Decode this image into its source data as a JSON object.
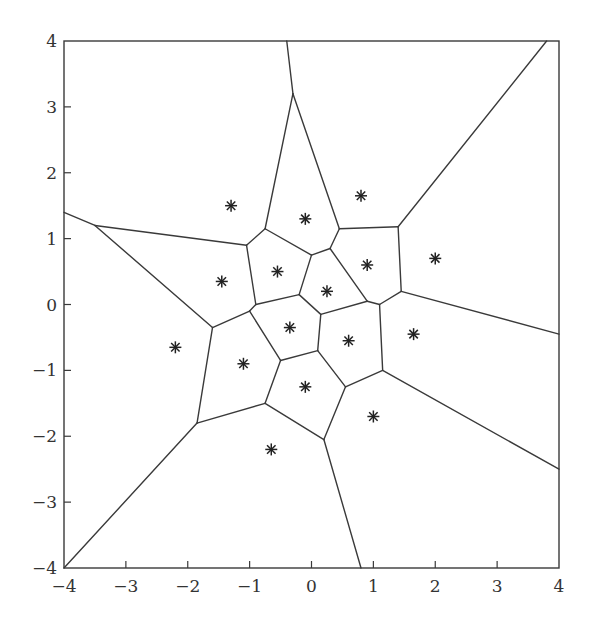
{
  "chart_data": {
    "type": "voronoi",
    "title": "",
    "xlabel": "",
    "ylabel": "",
    "xlim": [
      -4,
      4
    ],
    "ylim": [
      -4,
      4
    ],
    "grid": false,
    "legend": null,
    "x_ticks": [
      -4,
      -3,
      -2,
      -1,
      0,
      1,
      2,
      3,
      4
    ],
    "y_ticks": [
      -4,
      -3,
      -2,
      -1,
      0,
      1,
      2,
      3,
      4
    ],
    "x_tick_labels": [
      "−4",
      "−3",
      "−2",
      "−1",
      "0",
      "1",
      "2",
      "3",
      "4"
    ],
    "y_tick_labels": [
      "−4",
      "−3",
      "−2",
      "−1",
      "0",
      "1",
      "2",
      "3",
      "4"
    ],
    "marker": "asterisk",
    "sites": [
      {
        "x": -1.3,
        "y": 1.5
      },
      {
        "x": -0.1,
        "y": 1.3
      },
      {
        "x": 0.8,
        "y": 1.65
      },
      {
        "x": -1.45,
        "y": 0.35
      },
      {
        "x": -0.55,
        "y": 0.5
      },
      {
        "x": 0.25,
        "y": 0.2
      },
      {
        "x": 0.9,
        "y": 0.6
      },
      {
        "x": 2.0,
        "y": 0.7
      },
      {
        "x": -2.2,
        "y": -0.65
      },
      {
        "x": -1.1,
        "y": -0.9
      },
      {
        "x": -0.35,
        "y": -0.35
      },
      {
        "x": 0.6,
        "y": -0.55
      },
      {
        "x": 1.65,
        "y": -0.45
      },
      {
        "x": -0.1,
        "y": -1.25
      },
      {
        "x": 1.0,
        "y": -1.7
      },
      {
        "x": -0.65,
        "y": -2.2
      }
    ],
    "edges": [
      [
        [
          -0.4,
          4.0
        ],
        [
          -0.3,
          3.2
        ]
      ],
      [
        [
          -0.3,
          3.2
        ],
        [
          -0.75,
          1.15
        ]
      ],
      [
        [
          -0.3,
          3.2
        ],
        [
          0.45,
          1.15
        ]
      ],
      [
        [
          -4.0,
          1.4
        ],
        [
          -3.5,
          1.2
        ]
      ],
      [
        [
          -3.5,
          1.2
        ],
        [
          -1.05,
          0.9
        ]
      ],
      [
        [
          -3.5,
          1.2
        ],
        [
          -1.6,
          -0.35
        ]
      ],
      [
        [
          -1.05,
          0.9
        ],
        [
          -0.75,
          1.15
        ]
      ],
      [
        [
          -0.75,
          1.15
        ],
        [
          0.0,
          0.75
        ]
      ],
      [
        [
          -1.05,
          0.9
        ],
        [
          -0.9,
          0.0
        ]
      ],
      [
        [
          -0.9,
          0.0
        ],
        [
          -0.2,
          0.15
        ]
      ],
      [
        [
          0.0,
          0.75
        ],
        [
          -0.2,
          0.15
        ]
      ],
      [
        [
          0.0,
          0.75
        ],
        [
          0.3,
          0.85
        ]
      ],
      [
        [
          0.3,
          0.85
        ],
        [
          0.45,
          1.15
        ]
      ],
      [
        [
          0.45,
          1.15
        ],
        [
          1.4,
          1.18
        ]
      ],
      [
        [
          1.4,
          1.18
        ],
        [
          3.8,
          4.0
        ]
      ],
      [
        [
          1.4,
          1.18
        ],
        [
          1.45,
          0.2
        ]
      ],
      [
        [
          1.45,
          0.2
        ],
        [
          4.0,
          -0.45
        ]
      ],
      [
        [
          1.45,
          0.2
        ],
        [
          1.1,
          0.0
        ]
      ],
      [
        [
          1.1,
          0.0
        ],
        [
          0.9,
          0.05
        ]
      ],
      [
        [
          0.9,
          0.05
        ],
        [
          0.3,
          0.85
        ]
      ],
      [
        [
          0.9,
          0.05
        ],
        [
          0.15,
          -0.15
        ]
      ],
      [
        [
          -0.2,
          0.15
        ],
        [
          0.15,
          -0.15
        ]
      ],
      [
        [
          -0.9,
          0.0
        ],
        [
          -1.0,
          -0.1
        ]
      ],
      [
        [
          -1.6,
          -0.35
        ],
        [
          -1.0,
          -0.1
        ]
      ],
      [
        [
          -1.6,
          -0.35
        ],
        [
          -1.85,
          -1.8
        ]
      ],
      [
        [
          -1.85,
          -1.8
        ],
        [
          -4.0,
          -4.0
        ]
      ],
      [
        [
          -1.85,
          -1.8
        ],
        [
          -0.75,
          -1.5
        ]
      ],
      [
        [
          -1.0,
          -0.1
        ],
        [
          -0.5,
          -0.85
        ]
      ],
      [
        [
          -0.5,
          -0.85
        ],
        [
          0.1,
          -0.7
        ]
      ],
      [
        [
          0.15,
          -0.15
        ],
        [
          0.1,
          -0.7
        ]
      ],
      [
        [
          -0.5,
          -0.85
        ],
        [
          -0.75,
          -1.5
        ]
      ],
      [
        [
          -0.75,
          -1.5
        ],
        [
          0.2,
          -2.05
        ]
      ],
      [
        [
          0.2,
          -2.05
        ],
        [
          0.8,
          -4.0
        ]
      ],
      [
        [
          0.2,
          -2.05
        ],
        [
          0.55,
          -1.25
        ]
      ],
      [
        [
          0.1,
          -0.7
        ],
        [
          0.55,
          -1.25
        ]
      ],
      [
        [
          0.55,
          -1.25
        ],
        [
          1.15,
          -1.0
        ]
      ],
      [
        [
          1.15,
          -1.0
        ],
        [
          1.1,
          0.0
        ]
      ],
      [
        [
          1.15,
          -1.0
        ],
        [
          4.0,
          -2.5
        ]
      ]
    ]
  }
}
